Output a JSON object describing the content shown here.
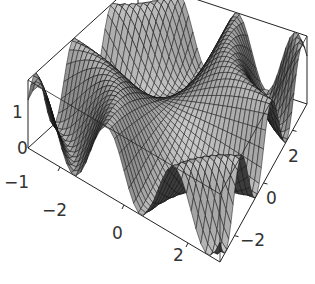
{
  "chart_data": {
    "type": "surface3d",
    "title": "",
    "function": "z = sin(x*y)",
    "x_range": [
      -3,
      3
    ],
    "y_range": [
      -3,
      3
    ],
    "z_range": [
      -1,
      1
    ],
    "grid_points": 40,
    "x_ticks": [
      "-2",
      "0",
      "2"
    ],
    "y_ticks": [
      "2",
      "0",
      "-2"
    ],
    "z_ticks": [
      "1",
      "0",
      "-1"
    ],
    "box": true,
    "mesh": true,
    "colors": {
      "surface_light": "#b8b8b8",
      "surface_dark": "#3a3a3a",
      "mesh": "#111111",
      "box": "#222222"
    }
  },
  "labels": {
    "z1": "1",
    "z0": "0",
    "zm1": "-1",
    "xm2": "-2",
    "x0": "0",
    "x2": "2",
    "y2": "2",
    "y0": "0",
    "ym2": "-2"
  }
}
